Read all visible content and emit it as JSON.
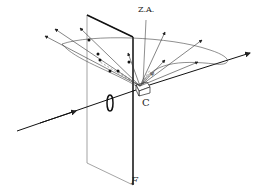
{
  "diagram": {
    "labels": {
      "zone_axis": "Z.A.",
      "crystal": "C",
      "film": "F"
    },
    "colors": {
      "line": "#222222",
      "background": "#ffffff"
    }
  }
}
